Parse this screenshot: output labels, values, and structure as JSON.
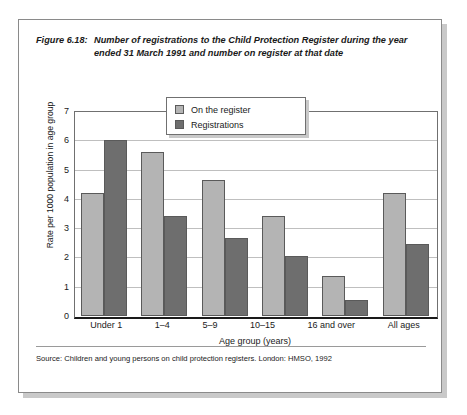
{
  "figure": {
    "label": "Figure 6.18:",
    "caption": "Number of registrations to the Child Protection Register during the year ended 31 March 1991 and number on register at that date",
    "source": "Source: Children and young persons on child protection registers. London: HMSO, 1992"
  },
  "legend": {
    "items": [
      {
        "label": "On the register",
        "color": "#b4b4b4"
      },
      {
        "label": "Registrations",
        "color": "#6e6e6e"
      }
    ]
  },
  "chart_data": {
    "type": "bar",
    "title": "Number of registrations to the Child Protection Register during the year ended 31 March 1991 and number on register at that date",
    "xlabel": "Age group (years)",
    "ylabel": "Rate per 1000 population in age group",
    "ylim": [
      0,
      7
    ],
    "yticks": [
      0,
      1,
      2,
      3,
      4,
      5,
      6,
      7
    ],
    "grid": true,
    "legend_position": "top-center",
    "categories": [
      "Under 1",
      "1–4",
      "5–9",
      "10–15",
      "16 and over",
      "All ages"
    ],
    "series": [
      {
        "name": "On the register",
        "color": "#b4b4b4",
        "values": [
          4.2,
          5.6,
          4.65,
          3.4,
          1.35,
          4.2
        ]
      },
      {
        "name": "Registrations",
        "color": "#6e6e6e",
        "values": [
          6.0,
          3.4,
          2.65,
          2.05,
          0.55,
          2.45
        ]
      }
    ]
  }
}
